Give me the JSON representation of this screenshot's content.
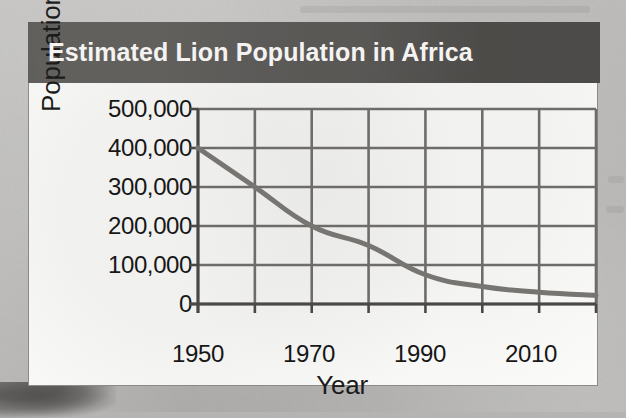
{
  "header": {
    "title": "Estimated Lion Population in Africa",
    "background_color": "#565451",
    "text_color": "#f4f3f1"
  },
  "card": {
    "background_color": "#fbfbfa",
    "border_color": "#8b8a88"
  },
  "page": {
    "background_color": "#b5b4b2"
  },
  "chart_data": {
    "type": "line",
    "title": "Estimated Lion Population in Africa",
    "xlabel": "Year",
    "ylabel": "Population",
    "x": [
      1950,
      1960,
      1970,
      1980,
      1990,
      2000,
      2010,
      2020
    ],
    "values": [
      400000,
      300000,
      200000,
      150000,
      75000,
      45000,
      30000,
      22000
    ],
    "series": [
      {
        "name": "Estimated lion population",
        "values": [
          400000,
          300000,
          200000,
          150000,
          75000,
          45000,
          30000,
          22000
        ]
      }
    ],
    "xlim": [
      1950,
      2020
    ],
    "ylim": [
      0,
      500000
    ],
    "xticks": [
      1950,
      1960,
      1970,
      1980,
      1990,
      2000,
      2010,
      2020
    ],
    "xtick_labels": [
      "1950",
      "",
      "1970",
      "",
      "1990",
      "",
      "2010",
      ""
    ],
    "yticks": [
      0,
      100000,
      200000,
      300000,
      400000,
      500000
    ],
    "ytick_labels": [
      "0",
      "100,000",
      "200,000",
      "300,000",
      "400,000",
      "500,000"
    ],
    "grid": true,
    "legend": false,
    "line_color": "#777572",
    "grid_color": "#6e6c6a",
    "axis_color": "#4a4846",
    "line_width": 5
  },
  "y_axis": {
    "labels": [
      "500,000",
      "400,000",
      "300,000",
      "200,000",
      "100,000",
      "0"
    ],
    "values": [
      500000,
      400000,
      300000,
      200000,
      100000,
      0
    ],
    "title": "Population"
  },
  "x_axis": {
    "labels": [
      "1950",
      "1970",
      "1990",
      "2010"
    ],
    "values": [
      1950,
      1970,
      1990,
      2010
    ],
    "title": "Year"
  }
}
